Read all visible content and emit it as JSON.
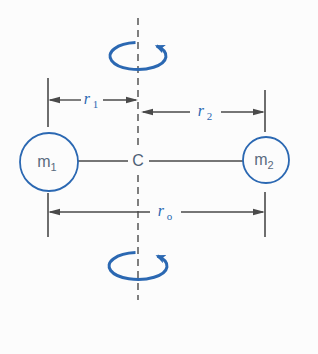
{
  "diagram": {
    "labels": {
      "m1": {
        "base": "m",
        "sub": "1"
      },
      "m2": {
        "base": "m",
        "sub": "2"
      },
      "center": "C",
      "r1": {
        "base": "r",
        "sub": "1"
      },
      "r2": {
        "base": "r",
        "sub": "2"
      },
      "r0": {
        "base": "r",
        "sub": "o"
      }
    },
    "icons": {
      "top": "rotation-arrow-icon",
      "bottom": "rotation-arrow-icon"
    },
    "colors": {
      "accent_blue": "#2b68b2",
      "line_gray": "#4a4a4a",
      "mass_text": "#5a6b7e",
      "background": "#fcfcfc"
    }
  }
}
